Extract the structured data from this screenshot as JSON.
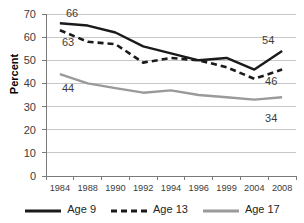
{
  "chart_data": {
    "type": "line",
    "title": "",
    "xlabel": "",
    "ylabel": "Percent",
    "categories": [
      "1984",
      "1988",
      "1990",
      "1992",
      "1994",
      "1996",
      "1999",
      "2004",
      "2008"
    ],
    "ylim": [
      0,
      70
    ],
    "ytick_step": 10,
    "yticks": [
      "70",
      "60",
      "50",
      "40",
      "30",
      "20",
      "10",
      "0"
    ],
    "grid": "horizontal",
    "legend_position": "bottom",
    "series": [
      {
        "name": "Age 9",
        "style": "solid",
        "color": "#1a1a1a",
        "values": [
          66,
          65,
          62,
          56,
          53,
          50,
          51,
          46,
          54
        ]
      },
      {
        "name": "Age 13",
        "style": "dashed",
        "color": "#1a1a1a",
        "values": [
          63,
          58,
          57,
          49,
          51,
          50,
          47,
          42,
          46
        ]
      },
      {
        "name": "Age 17",
        "style": "solid",
        "color": "#9a9a9a",
        "values": [
          44,
          40,
          38,
          36,
          37,
          35,
          34,
          33,
          34
        ]
      }
    ],
    "annotations": [
      {
        "text": "66",
        "series": "Age 9",
        "category": "1984",
        "value": 66
      },
      {
        "text": "63",
        "series": "Age 13",
        "category": "1984",
        "value": 63
      },
      {
        "text": "44",
        "series": "Age 17",
        "category": "1984",
        "value": 44
      },
      {
        "text": "54",
        "series": "Age 9",
        "category": "2008",
        "value": 54
      },
      {
        "text": "46",
        "series": "Age 13",
        "category": "2008",
        "value": 46
      },
      {
        "text": "34",
        "series": "Age 17",
        "category": "2008",
        "value": 34
      }
    ]
  },
  "legend": {
    "items": [
      {
        "label": "Age 9"
      },
      {
        "label": "Age 13"
      },
      {
        "label": "Age 17"
      }
    ]
  },
  "colors": {
    "series_dark": "#1a1a1a",
    "series_gray": "#9a9a9a",
    "gridline": "#c8c8c8",
    "axis": "#7a7a7a",
    "text": "#3b3b3b"
  }
}
